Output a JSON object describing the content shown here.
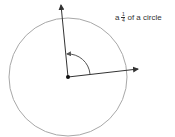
{
  "label": {
    "prefix": "a",
    "fraction_numerator": "1",
    "fraction_denominator": "4",
    "suffix": "of a circle"
  },
  "colors": {
    "circle": "#a8a8a8",
    "rays": "#333333",
    "text": "#333333"
  },
  "geometry": {
    "center": [
      68,
      77
    ],
    "radius": 59,
    "ray_up_end": [
      61,
      4
    ],
    "ray_right_end": [
      139,
      69
    ]
  }
}
